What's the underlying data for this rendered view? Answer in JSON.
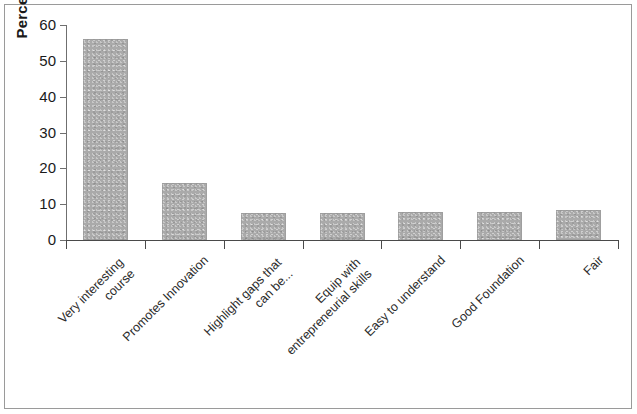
{
  "chart_data": {
    "type": "bar",
    "title": "",
    "subtitle": "",
    "xlabel": "",
    "ylabel": "Percentage",
    "ylim": [
      0,
      60
    ],
    "ytick_labels": [
      "60",
      "50",
      "40",
      "30",
      "20",
      "10",
      "0"
    ],
    "ytick_values": [
      60,
      50,
      40,
      30,
      20,
      10,
      0
    ],
    "ygrid": false,
    "legend": false,
    "legend_position": "none",
    "bar_color": "#aaaaaa",
    "categories": [
      "Very interesting\ncourse",
      "Promotes Innovation",
      "Highlight gaps that\ncan be...",
      "Equip with\nentrepreneurial skills",
      "Easy to understand",
      "Good Foundation",
      "Fair"
    ],
    "category_labels_rotation": -45,
    "values": [
      56,
      16,
      7.5,
      7.6,
      7.7,
      7.8,
      8.3
    ],
    "series": [
      {
        "name": "Percentage",
        "values": [
          56,
          16,
          7.5,
          7.6,
          7.7,
          7.8,
          8.3
        ]
      }
    ]
  },
  "axis": {
    "y_title": "Percentage"
  }
}
